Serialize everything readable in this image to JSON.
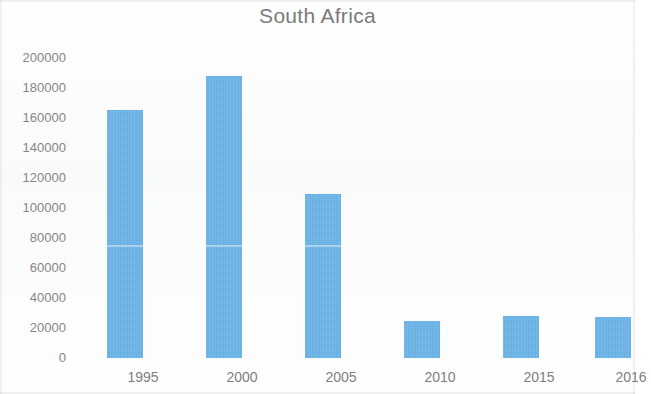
{
  "chart_data": {
    "type": "bar",
    "title": "South Africa",
    "xlabel": "",
    "ylabel": "",
    "categories": [
      "1995",
      "2000",
      "2005",
      "2010",
      "2015",
      "2016"
    ],
    "values": [
      165000,
      188000,
      109000,
      24500,
      28000,
      27000
    ],
    "series": [
      {
        "name": "South Africa",
        "values": [
          165000,
          188000,
          109000,
          24500,
          28000,
          27000
        ]
      }
    ],
    "ylim": [
      0,
      200000
    ],
    "y_ticks": [
      200000,
      180000,
      160000,
      140000,
      120000,
      100000,
      80000,
      60000,
      40000,
      20000,
      0
    ],
    "y_tick_labels": [
      "200000",
      "180000",
      "160000",
      "140000",
      "120000",
      "100000",
      "80000",
      "60000",
      "40000",
      "20000",
      "0"
    ],
    "grid": false,
    "legend": false,
    "legend_position": "none",
    "bar_color": "#6cb5e9",
    "title_color": "#7b7b7b",
    "tick_label_color": "#868686",
    "background_color": "#ffffff"
  }
}
